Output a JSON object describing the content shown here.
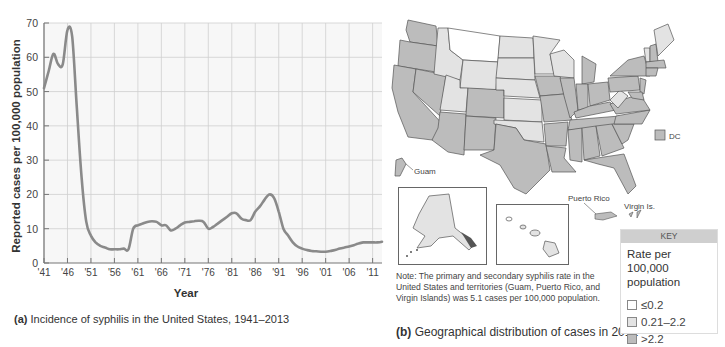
{
  "chart_data": [
    {
      "type": "line",
      "title": "Incidence of syphilis in the United States, 1941–2013",
      "xlabel": "Year",
      "ylabel": "Reported cases per 100,000 population",
      "ylim": [
        0,
        70
      ],
      "xlim": [
        1941,
        2013
      ],
      "grid": true,
      "x_tick_labels": [
        "'41",
        "'46",
        "'51",
        "'56",
        "'61",
        "'66",
        "'71",
        "'76",
        "'81",
        "'86",
        "'91",
        "'96",
        "'01",
        "'06",
        "'11"
      ],
      "y_tick_labels": [
        "0",
        "10",
        "20",
        "30",
        "40",
        "50",
        "60",
        "70"
      ],
      "series": [
        {
          "name": "Syphilis incidence",
          "x": [
            1941,
            1942,
            1943,
            1944,
            1945,
            1946,
            1947,
            1948,
            1949,
            1950,
            1951,
            1952,
            1953,
            1954,
            1955,
            1956,
            1957,
            1958,
            1959,
            1960,
            1961,
            1962,
            1963,
            1964,
            1965,
            1966,
            1967,
            1968,
            1969,
            1970,
            1971,
            1972,
            1973,
            1974,
            1975,
            1976,
            1977,
            1978,
            1979,
            1980,
            1981,
            1982,
            1983,
            1984,
            1985,
            1986,
            1987,
            1988,
            1989,
            1990,
            1991,
            1992,
            1993,
            1994,
            1995,
            1996,
            1997,
            1998,
            1999,
            2000,
            2001,
            2002,
            2003,
            2004,
            2005,
            2006,
            2007,
            2008,
            2009,
            2010,
            2011,
            2012,
            2013
          ],
          "values": [
            51,
            56,
            61,
            58,
            58,
            68,
            66,
            45,
            25,
            12,
            8,
            6,
            5,
            4.5,
            4,
            4,
            4,
            4.2,
            4,
            10,
            11,
            11.5,
            12,
            12.2,
            12,
            11,
            11,
            9.5,
            10,
            11,
            11.8,
            12,
            12.2,
            12.3,
            12,
            10,
            10.5,
            11.5,
            12.5,
            13.5,
            14.5,
            14.5,
            13,
            12.5,
            12.5,
            15,
            16.5,
            18.5,
            20,
            19,
            15,
            10,
            8,
            6,
            4.8,
            4.2,
            3.8,
            3.5,
            3.4,
            3.3,
            3.3,
            3.5,
            3.8,
            4.2,
            4.5,
            4.8,
            5.2,
            5.7,
            6,
            6,
            6,
            6,
            6.2
          ]
        }
      ]
    },
    {
      "type": "heatmap",
      "title": "Geographical distribution of cases in 2012",
      "legend": {
        "title": "Rate per 100,000 population",
        "bins": [
          "≤0.2",
          "0.21–2.2",
          ">2.2"
        ]
      },
      "regions": {
        "≤0.2": [
          "Montana"
        ],
        "0.21–2.2": [
          "Idaho",
          "Wyoming",
          "Utah",
          "North Dakota",
          "South Dakota",
          "Nebraska",
          "Kansas",
          "Oklahoma",
          "Minnesota",
          "Wisconsin",
          "West Virginia",
          "Maine",
          "Vermont",
          "Alaska",
          "Hawaii"
        ],
        ">2.2": [
          "Washington",
          "Oregon",
          "California",
          "Nevada",
          "Arizona",
          "New Mexico",
          "Colorado",
          "Texas",
          "Iowa",
          "Missouri",
          "Arkansas",
          "Louisiana",
          "Illinois",
          "Michigan",
          "Indiana",
          "Ohio",
          "Kentucky",
          "Tennessee",
          "Mississippi",
          "Alabama",
          "Georgia",
          "Florida",
          "South Carolina",
          "North Carolina",
          "Virginia",
          "Pennsylvania",
          "New York",
          "New Jersey",
          "Maryland",
          "Delaware",
          "Connecticut",
          "Massachusetts",
          "New Hampshire",
          "Rhode Island",
          "DC",
          "Guam",
          "Puerto Rico",
          "Virgin Islands"
        ]
      }
    }
  ],
  "panel_a": {
    "caption_label": "(a)",
    "caption_text": "Incidence of syphilis in the United States, 1941–2013",
    "ylabel": "Reported cases per 100,000 population",
    "xlabel": "Year"
  },
  "panel_b": {
    "caption_label": "(b)",
    "caption_text": "Geographical distribution of cases in 2012",
    "labels": {
      "dc": "DC",
      "guam": "Guam",
      "puerto_rico": "Puerto Rico",
      "virgin_islands": "Virgin Is."
    },
    "note": "Note: The primary and secondary syphilis rate in the United States and territories (Guam, Puerto Rico, and Virgin Islands) was 5.1 cases per 100,000 population.",
    "key": {
      "header": "KEY",
      "title": "Rate per 100,000 population",
      "items": [
        {
          "label": "≤0.2",
          "color": "#ffffff"
        },
        {
          "label": "0.21–2.2",
          "color": "#e3e3e3"
        },
        {
          "label": ">2.2",
          "color": "#bcbcbc"
        }
      ]
    }
  },
  "colors": {
    "line": "#8a8a8a",
    "grid": "#cfcfcf",
    "plot_bg": "#f7f7f7",
    "low": "#ffffff",
    "mid": "#e3e3e3",
    "high": "#bcbcbc"
  }
}
